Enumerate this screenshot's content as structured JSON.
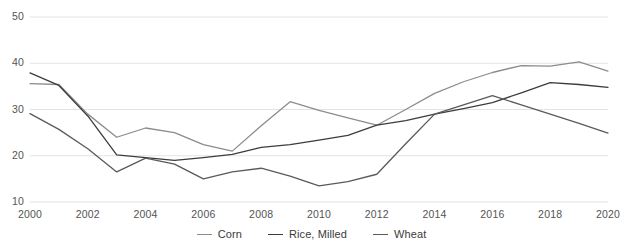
{
  "chart_data": {
    "type": "line",
    "title": "",
    "subtitle": "",
    "xlabel": "",
    "ylabel": "",
    "x": [
      2000,
      2001,
      2002,
      2003,
      2004,
      2005,
      2006,
      2007,
      2008,
      2009,
      2010,
      2011,
      2012,
      2013,
      2014,
      2015,
      2016,
      2017,
      2018,
      2019,
      2020
    ],
    "xlim": [
      2000,
      2020
    ],
    "ylim": [
      10,
      50
    ],
    "xticks": [
      2000,
      2002,
      2004,
      2006,
      2008,
      2010,
      2012,
      2014,
      2016,
      2018,
      2020
    ],
    "yticks": [
      10,
      20,
      30,
      40,
      50
    ],
    "grid": "horizontal",
    "legend_position": "bottom",
    "series": [
      {
        "name": "Corn",
        "color": "#8c8c8c",
        "values": [
          35.6,
          35.4,
          29.0,
          24.0,
          26.0,
          25.0,
          22.4,
          21.0,
          26.5,
          31.7,
          29.8,
          28.2,
          26.6,
          30.0,
          33.5,
          36.0,
          38.0,
          39.5,
          39.4,
          40.3,
          38.3
        ]
      },
      {
        "name": "Rice, Milled",
        "color": "#3c3c3c",
        "values": [
          37.9,
          35.2,
          28.6,
          20.2,
          19.6,
          19.0,
          19.6,
          20.3,
          21.8,
          22.4,
          23.4,
          24.4,
          26.6,
          27.6,
          29.0,
          30.2,
          31.5,
          33.6,
          35.8,
          35.4,
          34.8
        ]
      },
      {
        "name": "Wheat",
        "color": "#5a5a5a",
        "values": [
          29.1,
          25.7,
          21.5,
          16.5,
          19.5,
          18.2,
          15.0,
          16.5,
          17.3,
          15.6,
          13.5,
          14.4,
          16.0,
          22.6,
          29.0,
          31.0,
          33.0,
          31.0,
          29.0,
          27.0,
          24.9
        ]
      }
    ]
  },
  "axes": {
    "y_tick_labels": [
      "50",
      "40",
      "30",
      "20",
      "10"
    ],
    "x_tick_labels": [
      "2000",
      "2002",
      "2004",
      "2006",
      "2008",
      "2010",
      "2012",
      "2014",
      "2016",
      "2018",
      "2020"
    ]
  },
  "legend": {
    "items": [
      {
        "label": "Corn",
        "color": "#8c8c8c"
      },
      {
        "label": "Rice, Milled",
        "color": "#3c3c3c"
      },
      {
        "label": "Wheat",
        "color": "#5a5a5a"
      }
    ]
  }
}
